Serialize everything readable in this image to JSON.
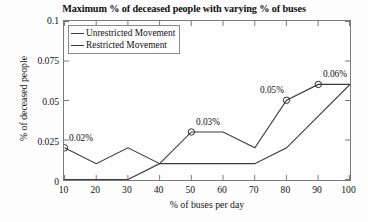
{
  "chart_data": {
    "type": "line",
    "title": "Maximum % of deceased people with varying % of buses",
    "xlabel": "% of buses per day",
    "ylabel": "% of deceased people",
    "x": [
      10,
      20,
      30,
      40,
      50,
      60,
      70,
      80,
      90,
      100
    ],
    "xlim": [
      10,
      100
    ],
    "ylim": [
      0,
      0.1
    ],
    "xticks": [
      "10",
      "20",
      "30",
      "40",
      "50",
      "60",
      "70",
      "80",
      "90",
      "100"
    ],
    "yticks": [
      "0",
      "0.025",
      "0.05",
      "0.075",
      "0.1"
    ],
    "ytick_values": [
      0,
      0.025,
      0.05,
      0.075,
      0.1
    ],
    "grid": false,
    "legend_position": "top-left",
    "series": [
      {
        "name": "Unrestricted Movement",
        "color": "#3a3a3a",
        "values": [
          0,
          0,
          0,
          0.01,
          0.01,
          0.01,
          0.01,
          0.02,
          0.04,
          0.06
        ]
      },
      {
        "name": "Restricted Movement",
        "color": "#3a3a3a",
        "values": [
          0.02,
          0.01,
          0.02,
          0.01,
          0.03,
          0.03,
          0.02,
          0.05,
          0.06,
          0.06
        ]
      }
    ],
    "annotations": [
      {
        "label": "0.02%",
        "x": 10,
        "y": 0.02,
        "marker": "circle"
      },
      {
        "label": "0.03%",
        "x": 50,
        "y": 0.03,
        "marker": "circle"
      },
      {
        "label": "0.05%",
        "x": 80,
        "y": 0.05,
        "marker": "circle"
      },
      {
        "label": "0.06%",
        "x": 90,
        "y": 0.06,
        "marker": "circle"
      }
    ]
  },
  "legend": {
    "items": [
      {
        "label": "Unrestricted Movement"
      },
      {
        "label": "Restricted Movement"
      }
    ]
  },
  "axes": {
    "title": "Maximum % of deceased people with varying % of buses",
    "x_label": "% of buses per day",
    "y_label": "% of deceased people",
    "x_ticks": [
      "10",
      "20",
      "30",
      "40",
      "50",
      "60",
      "70",
      "80",
      "90",
      "100"
    ],
    "y_ticks": [
      "0",
      "0.025",
      "0.05",
      "0.075",
      "0.1"
    ]
  },
  "annotation_labels": {
    "a0": "0.02%",
    "a1": "0.03%",
    "a2": "0.05%",
    "a3": "0.06%"
  }
}
